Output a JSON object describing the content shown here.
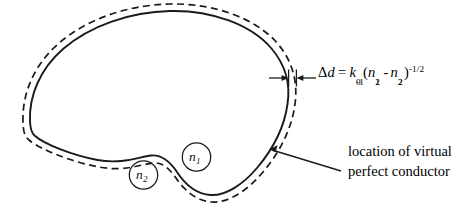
{
  "figure": {
    "type": "scientific-diagram",
    "background_color": "#ffffff",
    "ink_color": "#1a1a1a"
  },
  "shapes": {
    "inner_boundary": {
      "name": "solid-dielectric-boundary",
      "style": "solid",
      "description": "closed kidney/teardrop shaped curve"
    },
    "outer_boundary": {
      "name": "dashed-virtual-conductor-boundary",
      "style": "dashed",
      "description": "offset closed curve outside the solid boundary"
    }
  },
  "index_labels": [
    {
      "name": "index-n1",
      "base": "n",
      "sub": "1",
      "x": 189,
      "y": 150
    },
    {
      "name": "index-n2",
      "base": "n",
      "sub": "2",
      "x": 136,
      "y": 168
    }
  ],
  "gap_annotation": {
    "name": "gap-equation",
    "lhs_symbol": "Δ",
    "lhs_var": "d",
    "equals": "=",
    "k_symbol": "k",
    "k_sub": "0",
    "k_sup": "-1",
    "open_paren": "(",
    "n1": "n",
    "n1_sub": "1",
    "n1_sup": "2",
    "minus": "-",
    "n2": "n",
    "n2_sub": "2",
    "n2_sup": "2",
    "close_paren": ")",
    "final_exponent": "-1/2",
    "plain_text": "Δd = k₀⁻¹(n₁² - n₂²)⁻¹ᐟ²"
  },
  "caption": {
    "name": "virtual-conductor-caption",
    "line1": "location of virtual",
    "line2": "perfect conductor"
  },
  "arrows": {
    "gap_arrows": {
      "name": "gap-width-arrows",
      "description": "two opposing arrows marking the gap Δd between solid and dashed curve",
      "count": 2
    },
    "caption_leader": {
      "name": "caption-leader-arrow",
      "description": "leader line with arrowhead pointing from caption to dashed curve"
    }
  }
}
